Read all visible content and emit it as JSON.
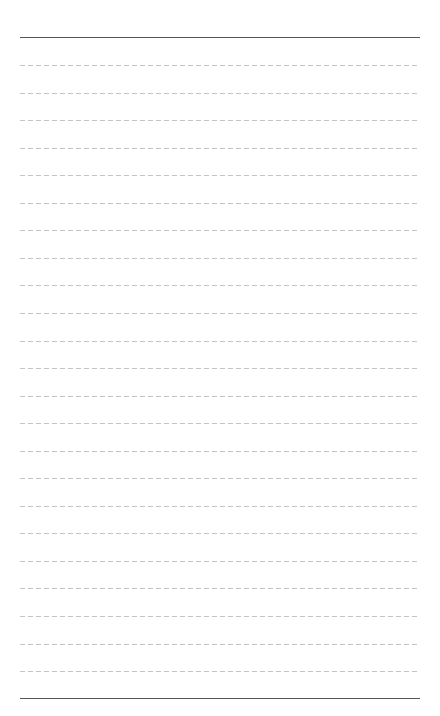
{
  "page": {
    "type": "lined-paper",
    "background_color": "#ffffff",
    "solid_line_color": "#555555",
    "dashed_line_color": "#c4c4c4",
    "top_rule_y": 37,
    "bottom_rule_y": 698,
    "dashed_first_y": 65,
    "dashed_spacing": 27.55,
    "dashed_line_count": 23,
    "left_margin": 20,
    "right_margin": 420
  }
}
